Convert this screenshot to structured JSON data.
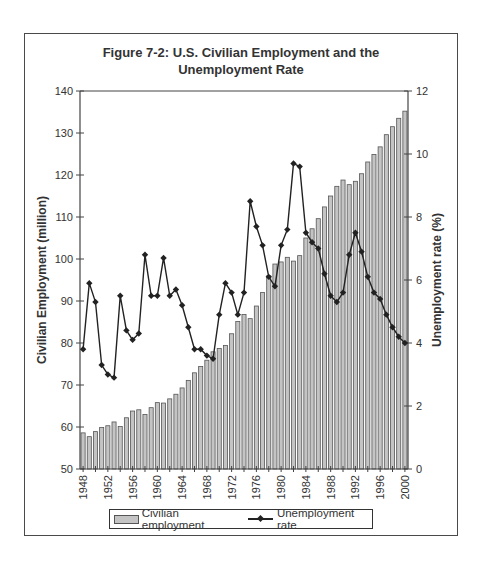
{
  "title_line1": "Figure 7-2: U.S. Civilian Employment and the",
  "title_line2": "Unemployment Rate",
  "legend": {
    "bar_label": "Civilian employment",
    "line_label": "Unemployment rate"
  },
  "colors": {
    "bar_fill": "#c4c4c4",
    "bar_stroke": "#555555",
    "line": "#222222",
    "axis": "#444444"
  },
  "chart_data": {
    "type": "bar+line",
    "title": "Figure 7-2: U.S. Civilian Employment and the Unemployment Rate",
    "xlabel": "",
    "ylabel": "Civilian Employment (million)",
    "y2label": "Unemployment rate (%)",
    "ylim": [
      50,
      140
    ],
    "y2lim": [
      0,
      12
    ],
    "yticks": [
      50,
      60,
      70,
      80,
      90,
      100,
      110,
      120,
      130,
      140
    ],
    "y2ticks": [
      0,
      2,
      4,
      6,
      8,
      10,
      12
    ],
    "xtick_labels": [
      "1948",
      "1952",
      "1956",
      "1960",
      "1964",
      "1968",
      "1972",
      "1976",
      "1980",
      "1984",
      "1988",
      "1992",
      "1996",
      "2000"
    ],
    "grid": false,
    "legend_position": "bottom",
    "categories": [
      1948,
      1949,
      1950,
      1951,
      1952,
      1953,
      1954,
      1955,
      1956,
      1957,
      1958,
      1959,
      1960,
      1961,
      1962,
      1963,
      1964,
      1965,
      1966,
      1967,
      1968,
      1969,
      1970,
      1971,
      1972,
      1973,
      1974,
      1975,
      1976,
      1977,
      1978,
      1979,
      1980,
      1981,
      1982,
      1983,
      1984,
      1985,
      1986,
      1987,
      1988,
      1989,
      1990,
      1991,
      1992,
      1993,
      1994,
      1995,
      1996,
      1997,
      1998,
      1999,
      2000
    ],
    "series": [
      {
        "name": "Civilian employment",
        "type": "bar",
        "axis": "left",
        "values": [
          58.6,
          57.7,
          58.9,
          59.9,
          60.3,
          61.2,
          60.1,
          62.2,
          63.8,
          64.1,
          63.0,
          64.6,
          65.8,
          65.7,
          66.7,
          67.8,
          69.3,
          71.1,
          72.9,
          74.4,
          75.9,
          77.9,
          78.7,
          79.4,
          82.2,
          85.1,
          86.8,
          85.8,
          88.8,
          92.0,
          96.0,
          98.8,
          99.3,
          100.4,
          99.5,
          100.8,
          105.0,
          107.2,
          109.6,
          112.4,
          115.0,
          117.3,
          118.8,
          117.7,
          118.5,
          120.3,
          123.1,
          124.9,
          126.7,
          129.6,
          131.5,
          133.5,
          135.2
        ]
      },
      {
        "name": "Unemployment rate",
        "type": "line",
        "axis": "right",
        "values": [
          3.8,
          5.9,
          5.3,
          3.3,
          3.0,
          2.9,
          5.5,
          4.4,
          4.1,
          4.3,
          6.8,
          5.5,
          5.5,
          6.7,
          5.5,
          5.7,
          5.2,
          4.5,
          3.8,
          3.8,
          3.6,
          3.5,
          4.9,
          5.9,
          5.6,
          4.9,
          5.6,
          8.5,
          7.7,
          7.1,
          6.1,
          5.8,
          7.1,
          7.6,
          9.7,
          9.6,
          7.5,
          7.2,
          7.0,
          6.2,
          5.5,
          5.3,
          5.6,
          6.8,
          7.5,
          6.9,
          6.1,
          5.6,
          5.4,
          4.9,
          4.5,
          4.2,
          4.0
        ]
      }
    ]
  }
}
